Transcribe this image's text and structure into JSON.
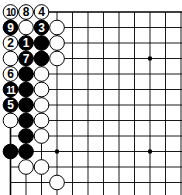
{
  "diagram": {
    "type": "go-board-fragment",
    "grid": {
      "origin_x": 10.5,
      "origin_y": 12,
      "spacing": 15.5,
      "cols": 12,
      "rows": 12,
      "top_edge": true,
      "left_edge": true,
      "line_color": "#000000",
      "background": "#ffffff"
    },
    "star_points": [
      {
        "col": 3,
        "row": 9
      },
      {
        "col": 9,
        "row": 3
      },
      {
        "col": 9,
        "row": 9
      }
    ],
    "stones": [
      {
        "col": 0,
        "row": 0,
        "color": "white",
        "label": "10"
      },
      {
        "col": 1,
        "row": 0,
        "color": "white",
        "label": "8"
      },
      {
        "col": 2,
        "row": 0,
        "color": "white",
        "label": "4"
      },
      {
        "col": 0,
        "row": 1,
        "color": "black",
        "label": "9"
      },
      {
        "col": 1,
        "row": 1,
        "color": "white",
        "label": ""
      },
      {
        "col": 2,
        "row": 1,
        "color": "black",
        "label": "3"
      },
      {
        "col": 3,
        "row": 1,
        "color": "white",
        "label": ""
      },
      {
        "col": 0,
        "row": 2,
        "color": "white",
        "label": "2"
      },
      {
        "col": 1,
        "row": 2,
        "color": "black",
        "label": "1"
      },
      {
        "col": 2,
        "row": 2,
        "color": "black",
        "label": ""
      },
      {
        "col": 3,
        "row": 2,
        "color": "white",
        "label": ""
      },
      {
        "col": 0,
        "row": 3,
        "color": "white",
        "label": ""
      },
      {
        "col": 1,
        "row": 3,
        "color": "black",
        "label": "7"
      },
      {
        "col": 2,
        "row": 3,
        "color": "black",
        "label": ""
      },
      {
        "col": 3,
        "row": 3,
        "color": "white",
        "label": ""
      },
      {
        "col": 0,
        "row": 4,
        "color": "white",
        "label": "6"
      },
      {
        "col": 1,
        "row": 4,
        "color": "black",
        "label": ""
      },
      {
        "col": 2,
        "row": 4,
        "color": "white",
        "label": ""
      },
      {
        "col": 0,
        "row": 5,
        "color": "black",
        "label": "11"
      },
      {
        "col": 1,
        "row": 5,
        "color": "black",
        "label": ""
      },
      {
        "col": 2,
        "row": 5,
        "color": "white",
        "label": ""
      },
      {
        "col": 0,
        "row": 6,
        "color": "black",
        "label": "5"
      },
      {
        "col": 1,
        "row": 6,
        "color": "black",
        "label": ""
      },
      {
        "col": 2,
        "row": 6,
        "color": "white",
        "label": ""
      },
      {
        "col": 0,
        "row": 7,
        "color": "white",
        "label": ""
      },
      {
        "col": 1,
        "row": 7,
        "color": "black",
        "label": ""
      },
      {
        "col": 2,
        "row": 7,
        "color": "white",
        "label": ""
      },
      {
        "col": 1,
        "row": 8,
        "color": "black",
        "label": ""
      },
      {
        "col": 2,
        "row": 8,
        "color": "white",
        "label": ""
      },
      {
        "col": 0,
        "row": 9,
        "color": "black",
        "label": ""
      },
      {
        "col": 1,
        "row": 9,
        "color": "black",
        "label": ""
      },
      {
        "col": 1,
        "row": 10,
        "color": "white",
        "label": ""
      },
      {
        "col": 2,
        "row": 10,
        "color": "white",
        "label": ""
      },
      {
        "col": 3,
        "row": 11,
        "color": "white",
        "label": ""
      }
    ]
  }
}
